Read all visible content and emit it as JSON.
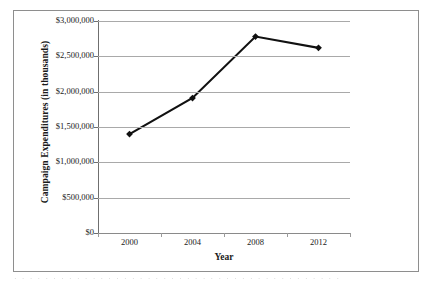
{
  "chart_data": {
    "type": "line",
    "title": "",
    "xlabel": "Year",
    "ylabel": "Campaign Expenditures (in thousands)",
    "categories": [
      "2000",
      "2004",
      "2008",
      "2012"
    ],
    "values": [
      1400000,
      1910000,
      2780000,
      2620000
    ],
    "series": [
      {
        "name": "Campaign Expenditures",
        "values": [
          1400000,
          1910000,
          2780000,
          2620000
        ]
      }
    ],
    "ylim": [
      0,
      3000000
    ],
    "ytick_values": [
      0,
      500000,
      1000000,
      1500000,
      2000000,
      2500000,
      3000000
    ],
    "ytick_labels": [
      "$0",
      "$500,000",
      "$1,000,000",
      "$1,500,000",
      "$2,000,000",
      "$2,500,000",
      "$3,000,000"
    ],
    "xtick_labels": [
      "2000",
      "2004",
      "2008",
      "2012"
    ],
    "grid": true,
    "grid_axis": "y",
    "legend": false,
    "legend_position": "none",
    "marker": "diamond",
    "line_color": "#111111",
    "marker_color": "#111111",
    "gridline_color": "#a9a9a9",
    "plot_background": "#ffffff",
    "frame_border_color": "#8e8e8e"
  },
  "figure": {
    "y_axis_title": "Campaign Expenditures (in thousands)",
    "x_axis_title": "Year",
    "scan_artifact_text": "· · · · · · · · · · · · · · · · · · · · · · · · · · · · · · · · · · · · · · · · · ·"
  }
}
